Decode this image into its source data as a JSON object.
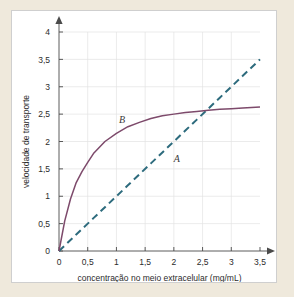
{
  "figure": {
    "background_color": "#efe9dc",
    "card_color": "#ffffff",
    "border_color": "#cfcfcf"
  },
  "chart_data": {
    "type": "line",
    "title": "",
    "xlabel": "concentração no meio extracelular (mg/mL)",
    "ylabel": "velocidade de transporte",
    "xlim": [
      0,
      3.5
    ],
    "ylim": [
      0,
      4
    ],
    "grid": true,
    "legend_position": "inline-annotations",
    "xticks": [
      0,
      0.5,
      1,
      1.5,
      2,
      2.5,
      3,
      3.5
    ],
    "xtick_labels": [
      "0",
      "0,5",
      "1",
      "1,5",
      "2",
      "2,5",
      "3",
      "3,5"
    ],
    "yticks": [
      0,
      0.5,
      1,
      1.5,
      2,
      2.5,
      3,
      3.5,
      4
    ],
    "ytick_labels": [
      "0",
      "0,5",
      "1",
      "1,5",
      "2",
      "2,5",
      "3",
      "3,5",
      "4"
    ],
    "x": [
      0,
      0.1,
      0.2,
      0.3,
      0.4,
      0.5,
      0.6,
      0.8,
      1.0,
      1.2,
      1.4,
      1.6,
      1.8,
      2.0,
      2.2,
      2.4,
      2.6,
      2.8,
      3.0,
      3.2,
      3.5
    ],
    "series": [
      {
        "name": "A",
        "label": "A",
        "style": "dashed",
        "color": "#2d6b7d",
        "description": "difusão simples - linear",
        "values": [
          0,
          0.1,
          0.2,
          0.3,
          0.4,
          0.5,
          0.6,
          0.8,
          1.0,
          1.2,
          1.4,
          1.6,
          1.8,
          2.0,
          2.2,
          2.4,
          2.6,
          2.8,
          3.0,
          3.2,
          3.5
        ],
        "label_x": 2.05,
        "label_y": 1.62
      },
      {
        "name": "B",
        "label": "B",
        "style": "solid",
        "color": "#7d4a6b",
        "description": "transporte mediado - saturação",
        "values": [
          0,
          0.55,
          0.95,
          1.25,
          1.45,
          1.62,
          1.78,
          2.0,
          2.15,
          2.27,
          2.35,
          2.42,
          2.47,
          2.5,
          2.53,
          2.55,
          2.57,
          2.59,
          2.6,
          2.61,
          2.63
        ],
        "label_x": 1.1,
        "label_y": 2.33
      }
    ],
    "intersection": {
      "x": 2.6,
      "y": 2.6
    }
  }
}
